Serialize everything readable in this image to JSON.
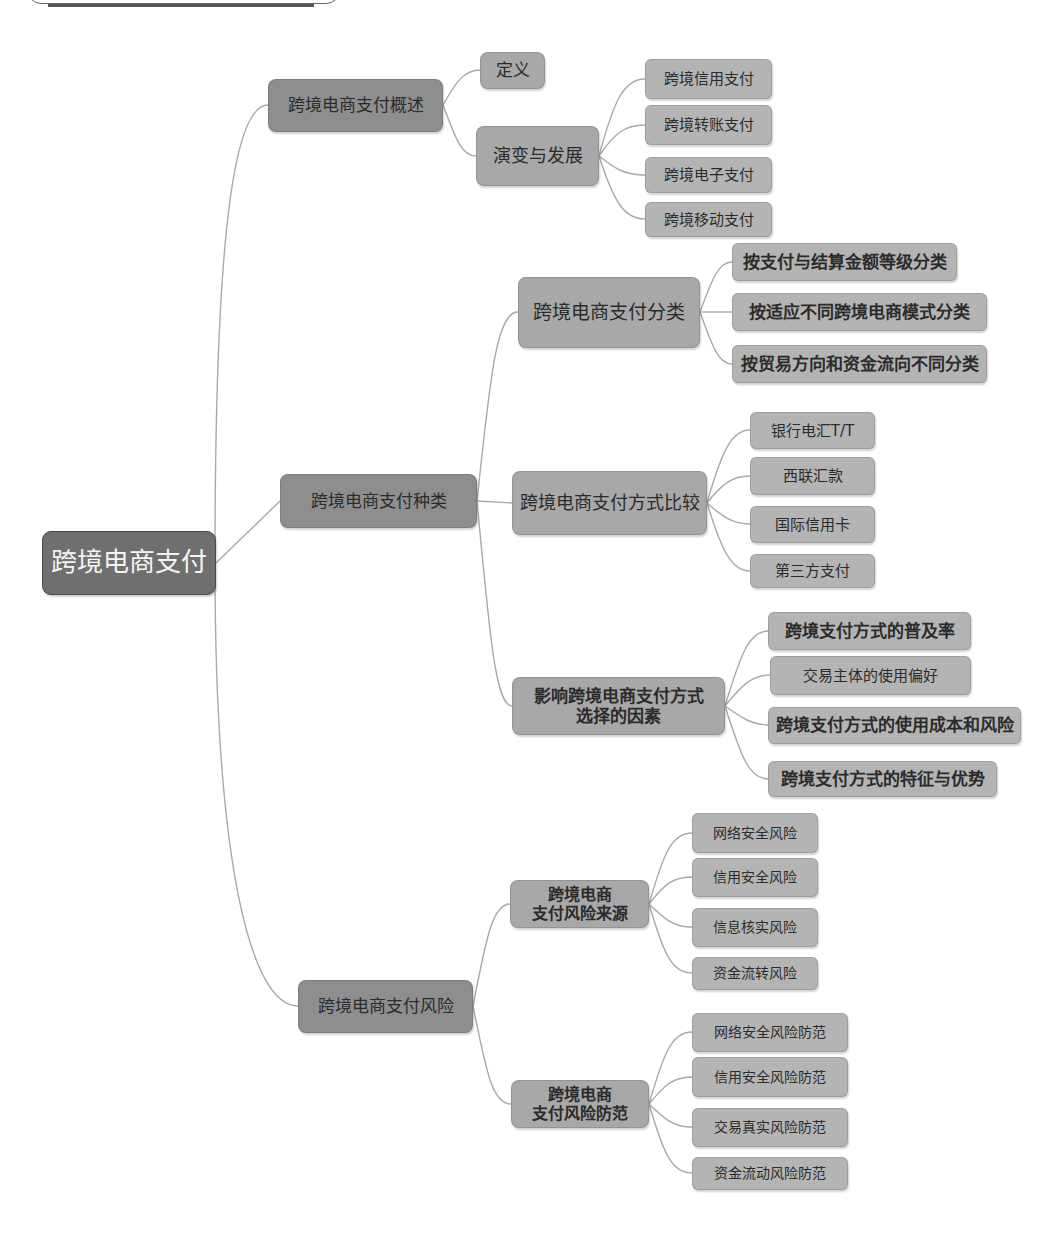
{
  "colors": {
    "background": "#ffffff",
    "root_fill": "#6f6f6f",
    "root_text": "#f4f4f4",
    "level1_fill": "#8e8e8e",
    "level2_fill": "#a8a8a8",
    "leaf_fill": "#b4b4b4",
    "node_text": "#2b2b2b",
    "connector": "#a9a9a9"
  },
  "mindmap": {
    "root": {
      "label": "跨境电商支付"
    },
    "branches": [
      {
        "label": "跨境电商支付概述",
        "children": [
          {
            "label": "定义"
          },
          {
            "label": "演变与发展",
            "children": [
              {
                "label": "跨境信用支付"
              },
              {
                "label": "跨境转账支付"
              },
              {
                "label": "跨境电子支付"
              },
              {
                "label": "跨境移动支付"
              }
            ]
          }
        ]
      },
      {
        "label": "跨境电商支付种类",
        "children": [
          {
            "label": "跨境电商支付分类",
            "children": [
              {
                "label": "按支付与结算金额等级分类"
              },
              {
                "label": "按适应不同跨境电商模式分类"
              },
              {
                "label": "按贸易方向和资金流向不同分类"
              }
            ]
          },
          {
            "label": "跨境电商支付方式比较",
            "children": [
              {
                "label": "银行电汇T/T"
              },
              {
                "label": "西联汇款"
              },
              {
                "label": "国际信用卡"
              },
              {
                "label": "第三方支付"
              }
            ]
          },
          {
            "label": "影响跨境电商支付方式\n选择的因素",
            "children": [
              {
                "label": "跨境支付方式的普及率"
              },
              {
                "label": "交易主体的使用偏好"
              },
              {
                "label": "跨境支付方式的使用成本和风险"
              },
              {
                "label": "跨境支付方式的特征与优势"
              }
            ]
          }
        ]
      },
      {
        "label": "跨境电商支付风险",
        "children": [
          {
            "label": "跨境电商\n支付风险来源",
            "children": [
              {
                "label": "网络安全风险"
              },
              {
                "label": "信用安全风险"
              },
              {
                "label": "信息核实风险"
              },
              {
                "label": "资金流转风险"
              }
            ]
          },
          {
            "label": "跨境电商\n支付风险防范",
            "children": [
              {
                "label": "网络安全风险防范"
              },
              {
                "label": "信用安全风险防范"
              },
              {
                "label": "交易真实风险防范"
              },
              {
                "label": "资金流动风险防范"
              }
            ]
          }
        ]
      }
    ]
  }
}
